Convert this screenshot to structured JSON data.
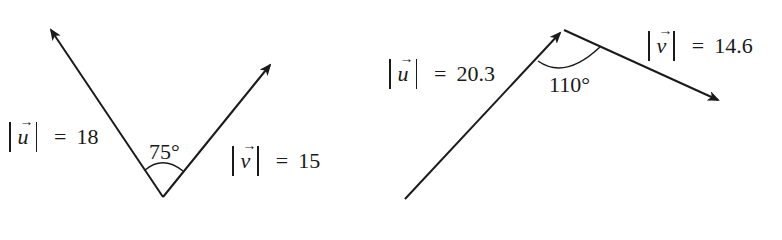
{
  "diagrams": [
    {
      "u": {
        "symbol": "u",
        "arrow": "→",
        "label_eq": "=",
        "magnitude": "18"
      },
      "v": {
        "symbol": "v",
        "arrow": "→",
        "label_eq": "=",
        "magnitude": "15"
      },
      "angle": "75°"
    },
    {
      "u": {
        "symbol": "u",
        "arrow": "→",
        "label_eq": "=",
        "magnitude": "20.3"
      },
      "v": {
        "symbol": "v",
        "arrow": "→",
        "label_eq": "=",
        "magnitude": "14.6"
      },
      "angle": "110°"
    }
  ],
  "colors": {
    "stroke": "#1a1a1a",
    "background": "#ffffff"
  }
}
